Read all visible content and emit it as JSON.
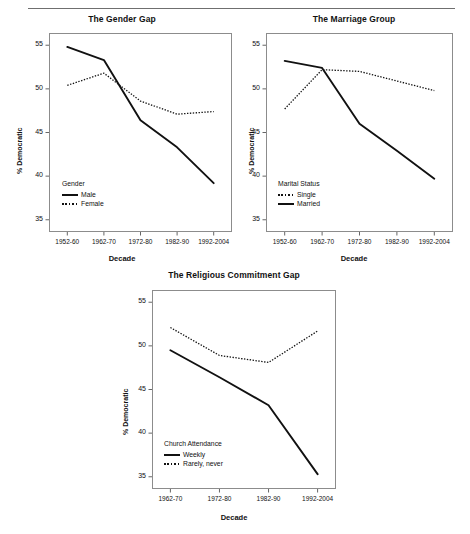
{
  "figure": {
    "has_top_rule": true,
    "background": "#ffffff",
    "line_color": "#111111"
  },
  "chart_data": [
    {
      "type": "line",
      "title": "The Gender Gap",
      "xlabel": "Decade",
      "ylabel": "% Democratic",
      "categories": [
        "1952-60",
        "1962-70",
        "1972-80",
        "1982-90",
        "1992-2004"
      ],
      "yticks": [
        35,
        40,
        45,
        50,
        55
      ],
      "ylim": [
        33.6,
        56.4
      ],
      "grid": false,
      "legend_position": "inside-bottom-left",
      "legend_title": "Gender",
      "series": [
        {
          "name": "Male",
          "style": "solid",
          "values": [
            54.8,
            53.3,
            46.4,
            43.3,
            39.2
          ]
        },
        {
          "name": "Female",
          "style": "dotted",
          "values": [
            50.4,
            51.8,
            48.6,
            47.1,
            47.4
          ]
        }
      ],
      "legend_order": [
        "Male",
        "Female"
      ]
    },
    {
      "type": "line",
      "title": "The Marriage Group",
      "xlabel": "Decade",
      "ylabel": "% Democratic",
      "categories": [
        "1952-60",
        "1962-70",
        "1972-80",
        "1982-90",
        "1992-2004"
      ],
      "yticks": [
        35,
        40,
        45,
        50,
        55
      ],
      "ylim": [
        33.6,
        56.4
      ],
      "grid": false,
      "legend_position": "inside-bottom-left",
      "legend_title": "Marital Status",
      "series": [
        {
          "name": "Single",
          "style": "dotted",
          "values": [
            47.7,
            52.2,
            52.0,
            50.9,
            49.8
          ]
        },
        {
          "name": "Married",
          "style": "solid",
          "values": [
            53.2,
            52.4,
            46.0,
            42.9,
            39.7
          ]
        }
      ],
      "legend_order": [
        "Single",
        "Married"
      ]
    },
    {
      "type": "line",
      "title": "The Religious Commitment Gap",
      "xlabel": "Decade",
      "ylabel": "% Democratic",
      "categories": [
        "1962-70",
        "1972-80",
        "1982-90",
        "1992-2004"
      ],
      "yticks": [
        35,
        40,
        45,
        50,
        55
      ],
      "ylim": [
        33.6,
        56.4
      ],
      "grid": false,
      "legend_position": "inside-bottom-left",
      "legend_title": "Church Attendance",
      "series": [
        {
          "name": "Weekly",
          "style": "solid",
          "values": [
            49.5,
            46.4,
            43.2,
            35.3
          ]
        },
        {
          "name": "Rarely, never",
          "style": "dotted",
          "values": [
            52.1,
            48.9,
            48.1,
            51.7
          ]
        }
      ],
      "legend_order": [
        "Weekly",
        "Rarely, never"
      ]
    }
  ]
}
